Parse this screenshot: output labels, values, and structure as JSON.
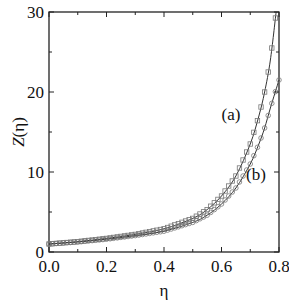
{
  "chart_data": {
    "type": "line",
    "title": "",
    "xlabel": "η",
    "ylabel": "Z(η)",
    "xlim": [
      0.0,
      0.8
    ],
    "ylim": [
      0,
      30
    ],
    "xticks": [
      "0.0",
      "0.2",
      "0.4",
      "0.6",
      "0.8"
    ],
    "yticks": [
      "0",
      "10",
      "20",
      "30"
    ],
    "grid": false,
    "legend": null,
    "annotations": [
      "(a)",
      "(b)"
    ],
    "series": [
      {
        "name": "(a)",
        "style": "solid line with open square markers",
        "x": [
          0.0,
          0.1,
          0.2,
          0.3,
          0.4,
          0.5,
          0.55,
          0.6,
          0.65,
          0.7,
          0.73,
          0.75,
          0.77,
          0.79
        ],
        "y": [
          1.0,
          1.3,
          1.7,
          2.2,
          2.9,
          4.2,
          5.3,
          7.0,
          9.5,
          13.5,
          17.0,
          20.0,
          24.0,
          30.0
        ]
      },
      {
        "name": "(b)",
        "style": "solid line with open circle markers",
        "x": [
          0.0,
          0.1,
          0.2,
          0.3,
          0.4,
          0.5,
          0.55,
          0.6,
          0.65,
          0.7,
          0.73,
          0.75,
          0.77,
          0.8
        ],
        "y": [
          1.0,
          1.25,
          1.6,
          2.05,
          2.6,
          3.7,
          4.6,
          6.0,
          8.0,
          11.0,
          13.5,
          15.5,
          18.0,
          21.5
        ]
      }
    ]
  }
}
